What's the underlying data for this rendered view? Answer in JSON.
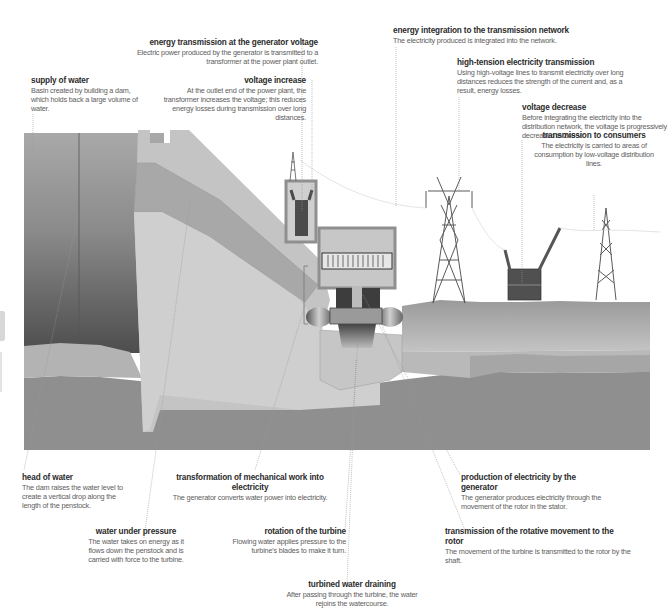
{
  "diagram": {
    "colors": {
      "background": "#ffffff",
      "reservoir_top": "#9a9a9a",
      "reservoir_bottom": "#5a5a5a",
      "dam": "#bdbdbd",
      "dam_light": "#cfcfcf",
      "penstock": "#a9a9a9",
      "bedrock": "#8e8e8e",
      "sediment": "#b3b3b3",
      "ground_top": "#a4a4a4",
      "building_frame": "#8f8f8f",
      "tower": "#6a6a6a",
      "transformer": "#555555",
      "leader_line": "#888888"
    }
  },
  "labels": {
    "energy_transmission_generator": {
      "title": "energy transmission at the generator voltage",
      "desc": "Electric power produced by the generator is transmitted to a transformer at the power plant outlet."
    },
    "supply_of_water": {
      "title": "supply of water",
      "desc": "Basin created by building a dam, which holds back a large volume of water."
    },
    "voltage_increase": {
      "title": "voltage increase",
      "desc": "At the outlet end of the power plant, the transformer increases the voltage; this reduces energy losses during transmission over long distances."
    },
    "energy_integration": {
      "title": "energy integration to the transmission network",
      "desc": "The electricity produced is integrated into the network."
    },
    "high_tension": {
      "title": "high-tension electricity transmission",
      "desc": "Using high-voltage lines to transmit electricity over long distances reduces the strength of the current and, as a result, energy losses."
    },
    "voltage_decrease": {
      "title": "voltage decrease",
      "desc": "Before integrating the electricity into the distribution network, the voltage is progressively decreased to 240 V."
    },
    "transmission_consumers": {
      "title": "transmission to consumers",
      "desc": "The electricity is carried to areas of consumption by low-voltage distribution lines."
    },
    "head_of_water": {
      "title": "head of water",
      "desc": "The dam raises the water level to create a vertical drop along the length of the penstock."
    },
    "transformation_mechanical": {
      "title": "transformation of mechanical work into electricity",
      "desc": "The generator converts water power into electricity."
    },
    "production_electricity": {
      "title": "production of electricity by the generator",
      "desc": "The generator produces electricity through the movement of the rotor in the stator."
    },
    "water_under_pressure": {
      "title": "water under pressure",
      "desc": "The water takes on energy as it flows down the penstock and is carried with force to the turbine."
    },
    "rotation_turbine": {
      "title": "rotation of the turbine",
      "desc": "Flowing water applies pressure to the turbine's blades to make it turn."
    },
    "transmission_rotative": {
      "title": "transmission of the rotative movement to the rotor",
      "desc": "The movement of the turbine is transmitted to the rotor by the shaft."
    },
    "turbined_water": {
      "title": "turbined water draining",
      "desc": "After passing through the turbine, the water rejoins the watercourse."
    }
  }
}
